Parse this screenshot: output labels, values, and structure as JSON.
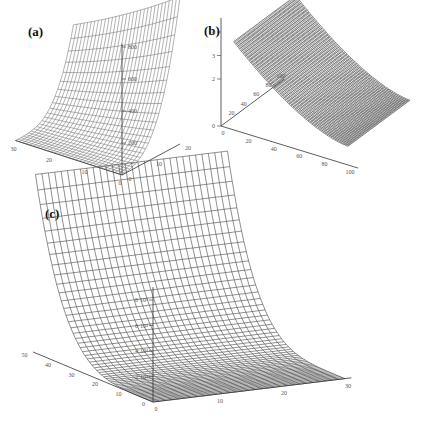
{
  "chart_data": [
    {
      "id": "a",
      "panel_label": "(a)",
      "type": "surface",
      "title": "",
      "axes": {
        "x": {
          "ticks": [
            "0",
            "10",
            "20",
            "30"
          ],
          "range": [
            0,
            30
          ]
        },
        "y": {
          "ticks": [
            "0",
            "10",
            "20"
          ],
          "range": [
            0,
            20
          ]
        },
        "z": {
          "ticks": [
            "200",
            "400",
            "600",
            "800"
          ],
          "range": [
            0,
            800
          ]
        }
      },
      "grid": {
        "rows": 30,
        "cols": 22
      },
      "description": "Wireframe surface rising exponentially along one horizontal axis, flat near origin, peaking around 900"
    },
    {
      "id": "b",
      "panel_label": "(b)",
      "type": "surface",
      "title": "",
      "axes": {
        "x": {
          "ticks": [
            "0",
            "20",
            "40",
            "60",
            "80",
            "100"
          ],
          "range": [
            0,
            100
          ]
        },
        "y": {
          "ticks": [
            "20",
            "40",
            "60",
            "80",
            "100"
          ],
          "range": [
            0,
            100
          ]
        },
        "z": {
          "ticks": [
            "0",
            "2",
            "3",
            "4"
          ],
          "range": [
            0,
            4.5
          ]
        }
      },
      "grid": {
        "rows": 100,
        "cols": 100
      },
      "description": "Dense wireframe surface decreasing from about 4.3 to about 0.8 along x, nearly constant along y"
    },
    {
      "id": "c",
      "panel_label": "(c)",
      "type": "surface",
      "title": "",
      "axes": {
        "x": {
          "ticks": [
            "0",
            "10",
            "20",
            "30"
          ],
          "range": [
            0,
            30
          ]
        },
        "y": {
          "ticks": [
            "0",
            "10",
            "20",
            "30",
            "40",
            "50"
          ],
          "range": [
            0,
            50
          ]
        },
        "z": {
          "ticks": [
            "2·10⁴",
            "4·10⁴",
            "6·10⁴",
            "8·10⁴"
          ],
          "range": [
            0,
            100000
          ]
        }
      },
      "grid": {
        "rows": 50,
        "cols": 30
      },
      "description": "Wireframe surface rising steeply along the y axis toward 50, flat near y=0"
    }
  ]
}
